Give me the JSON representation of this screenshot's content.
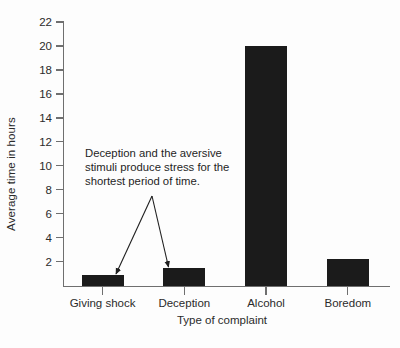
{
  "chart_data": {
    "type": "bar",
    "title": "",
    "xlabel": "Type of complaint",
    "ylabel": "Average time in hours",
    "categories": [
      "Giving shock",
      "Deception",
      "Alcohol",
      "Boredom"
    ],
    "values": [
      0.9,
      1.5,
      20.0,
      2.2
    ],
    "ylim": [
      0,
      22
    ],
    "yticks": [
      2,
      4,
      6,
      8,
      10,
      12,
      14,
      16,
      18,
      20,
      22
    ],
    "ytick_labels": [
      "2",
      "4",
      "6",
      "8",
      "10",
      "12",
      "14",
      "16",
      "18",
      "20",
      "22"
    ],
    "grid": false,
    "legend": false,
    "legend_position": "none",
    "bar_color": "#1b1b1b",
    "axis_color": "#6f6f6f",
    "annotations": [
      {
        "text": "Deception and the aversive stimuli produce stress for the shortest period of time.",
        "lines": [
          "Deception and the aversive",
          "stimuli produce stress for the",
          "shortest period of time."
        ],
        "points_to": [
          "Giving shock",
          "Deception"
        ],
        "arrow_count": 2
      }
    ]
  },
  "axis": {
    "y_title": "Average time in hours",
    "x_title": "Type of complaint"
  }
}
